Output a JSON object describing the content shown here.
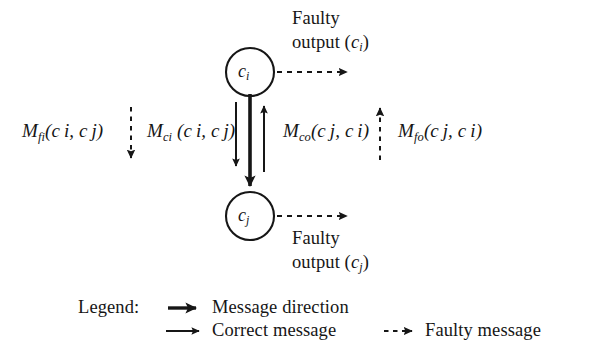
{
  "figure": {
    "type": "node-message-diagram",
    "background_color": "#ffffff",
    "stroke_color": "#161616"
  },
  "nodes": [
    {
      "id": "ci",
      "label_base": "c",
      "label_sub": "i",
      "cx": 250,
      "cy": 72,
      "r": 24
    },
    {
      "id": "cj",
      "label_base": "c",
      "label_sub": "j",
      "cx": 250,
      "cy": 216,
      "r": 24
    }
  ],
  "outputs": {
    "top": {
      "line1": "Faulty",
      "line2_base": "output (",
      "line2_sub": "c",
      "line2_subscript": "i",
      "line2_close": ")",
      "arrow": "faulty-dashed-right"
    },
    "bottom": {
      "line1": "Faulty",
      "line2_base": "output (",
      "line2_sub": "c",
      "line2_subscript": "j",
      "line2_close": ")",
      "arrow": "faulty-dashed-right"
    }
  },
  "messages": [
    {
      "id": "m-fi",
      "base": "M",
      "sub": "fi",
      "args": "(c i, c j)",
      "arg_parts": {
        "open": "(",
        "a": "c",
        "a_sub": "i",
        "comma": ", ",
        "b": "c",
        "b_sub": "j",
        "close": ")"
      },
      "arrow_style": "dashed",
      "arrow_direction": "down"
    },
    {
      "id": "m-ci",
      "base": "M",
      "sub": "ci",
      "args": " (c i, c j)",
      "arg_parts": {
        "open": "(",
        "a": "c",
        "a_sub": "i",
        "comma": ", ",
        "b": "c",
        "b_sub": "j",
        "close": ")"
      },
      "arrow_style": "solid",
      "arrow_direction": "down"
    },
    {
      "id": "m-co",
      "base": "M",
      "sub": "co",
      "args": "(c j, c i)",
      "arg_parts": {
        "open": "(",
        "a": "c",
        "a_sub": "j",
        "comma": ", ",
        "b": "c",
        "b_sub": "i",
        "close": ")"
      },
      "arrow_style": "solid",
      "arrow_direction": "up"
    },
    {
      "id": "m-fo",
      "base": "M",
      "sub": "fo",
      "args": "(c j, c i)",
      "arg_parts": {
        "open": "(",
        "a": "c",
        "a_sub": "j",
        "comma": ", ",
        "b": "c",
        "b_sub": "i",
        "close": ")"
      },
      "arrow_style": "dashed",
      "arrow_direction": "up"
    }
  ],
  "main_flow": {
    "id": "message-direction-arrow",
    "description": "thick arrow from ci to cj",
    "style": "thick-solid",
    "direction": "down"
  },
  "legend": {
    "title": "Legend:",
    "items": [
      {
        "id": "message-direction",
        "label": "Message direction",
        "arrow": "thick-solid-right"
      },
      {
        "id": "correct-message",
        "label": "Correct message",
        "arrow": "thin-solid-right"
      },
      {
        "id": "faulty-message",
        "label": "Faulty message",
        "arrow": "dashed-right"
      }
    ]
  }
}
